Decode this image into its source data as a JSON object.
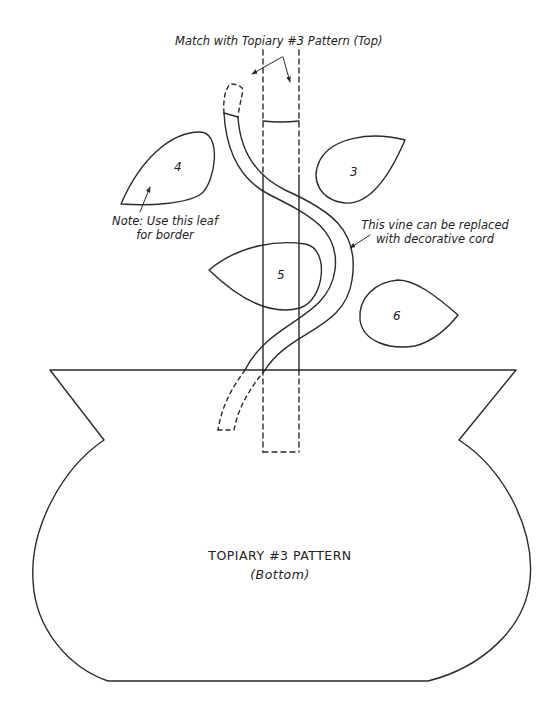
{
  "pattern": {
    "title": "TOPIARY #3 PATTERN",
    "subtitle": "(Bottom)"
  },
  "annotations": {
    "match_note": "Match with Topiary #3 Pattern (Top)",
    "leaf_note_line1": "Note: Use this leaf",
    "leaf_note_line2": "for border",
    "vine_note_line1": "This vine can be replaced",
    "vine_note_line2": "with decorative cord"
  },
  "pieces": {
    "leaves": [
      {
        "number": "4"
      },
      {
        "number": "3"
      },
      {
        "number": "5"
      },
      {
        "number": "6"
      }
    ],
    "stem": "stem",
    "vine": "vine",
    "pot": "pot"
  },
  "colors": {
    "line": "#2a2a2a",
    "background": "#ffffff"
  }
}
